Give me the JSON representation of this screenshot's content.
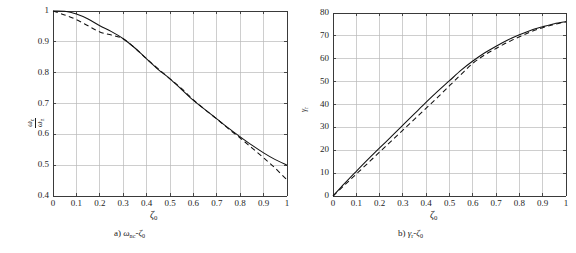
{
  "figure": {
    "background": "#ffffff",
    "axis_color": "#3a3a3a",
    "grid_color": "#b9b9b9",
    "curve_color": "#111111"
  },
  "panels": [
    {
      "id": "panel-a",
      "caption": "a) ωnc-ζ0",
      "caption_parts": {
        "prefix": "a) ",
        "sym1": "ω",
        "sub1": "nc",
        "dash": "-",
        "sym2": "ζ",
        "sub2": "0"
      },
      "xlabel": "ζ",
      "xlabel_sub": "0",
      "ylabel_num": "ω",
      "ylabel_num_sub": "c",
      "ylabel_den": "ω",
      "ylabel_den_sub": "n",
      "xticks": [
        "0",
        "0.1",
        "0.2",
        "0.3",
        "0.4",
        "0.5",
        "0.6",
        "0.7",
        "0.8",
        "0.9",
        "1"
      ],
      "yticks": [
        "0.4",
        "0.5",
        "0.6",
        "0.7",
        "0.8",
        "0.9",
        "1"
      ]
    },
    {
      "id": "panel-b",
      "caption": "b) γr-ζ0",
      "caption_parts": {
        "prefix": "b) ",
        "sym1": "γ",
        "sub1": "r",
        "dash": "-",
        "sym2": "ζ",
        "sub2": "0"
      },
      "xlabel": "ζ",
      "xlabel_sub": "0",
      "ylabel_num": "γ",
      "ylabel_num_sub": "r",
      "ylabel_den": "",
      "ylabel_den_sub": "",
      "xticks": [
        "0",
        "0.1",
        "0.2",
        "0.3",
        "0.4",
        "0.5",
        "0.6",
        "0.7",
        "0.8",
        "0.9",
        "1"
      ],
      "yticks": [
        "0",
        "10",
        "20",
        "30",
        "40",
        "50",
        "60",
        "70",
        "80"
      ]
    }
  ],
  "chart_data": [
    {
      "type": "line",
      "title": "a) ωnc-ζ0",
      "xlabel": "ζ0",
      "ylabel": "ωc/ωn",
      "xlim": [
        0,
        1
      ],
      "ylim": [
        0.4,
        1.0
      ],
      "xticks": [
        0,
        0.1,
        0.2,
        0.3,
        0.4,
        0.5,
        0.6,
        0.7,
        0.8,
        0.9,
        1
      ],
      "yticks": [
        0.4,
        0.5,
        0.6,
        0.7,
        0.8,
        0.9,
        1
      ],
      "grid": true,
      "legend": "none",
      "x": [
        0,
        0.05,
        0.1,
        0.15,
        0.2,
        0.25,
        0.3,
        0.35,
        0.4,
        0.45,
        0.5,
        0.55,
        0.6,
        0.65,
        0.7,
        0.75,
        0.8,
        0.85,
        0.9,
        0.95,
        1.0
      ],
      "series": [
        {
          "name": "solid",
          "style": "solid",
          "values": [
            1.0,
            0.999,
            0.99,
            0.974,
            0.952,
            0.933,
            0.91,
            0.88,
            0.845,
            0.81,
            0.78,
            0.745,
            0.71,
            0.68,
            0.65,
            0.62,
            0.592,
            0.565,
            0.54,
            0.518,
            0.5
          ]
        },
        {
          "name": "dashed",
          "style": "dashed",
          "values": [
            1.0,
            0.987,
            0.972,
            0.952,
            0.932,
            0.922,
            0.91,
            0.88,
            0.845,
            0.812,
            0.78,
            0.748,
            0.712,
            0.68,
            0.65,
            0.618,
            0.588,
            0.556,
            0.524,
            0.49,
            0.452
          ]
        }
      ]
    },
    {
      "type": "line",
      "title": "b) γr-ζ0",
      "xlabel": "ζ0",
      "ylabel": "γr",
      "xlim": [
        0,
        1
      ],
      "ylim": [
        0,
        80
      ],
      "xticks": [
        0,
        0.1,
        0.2,
        0.3,
        0.4,
        0.5,
        0.6,
        0.7,
        0.8,
        0.9,
        1
      ],
      "yticks": [
        0,
        10,
        20,
        30,
        40,
        50,
        60,
        70,
        80
      ],
      "grid": true,
      "legend": "none",
      "x": [
        0,
        0.05,
        0.1,
        0.15,
        0.2,
        0.25,
        0.3,
        0.35,
        0.4,
        0.45,
        0.5,
        0.55,
        0.6,
        0.65,
        0.7,
        0.75,
        0.8,
        0.85,
        0.9,
        0.95,
        1.0
      ],
      "series": [
        {
          "name": "solid",
          "style": "solid",
          "values": [
            0,
            5.5,
            10.8,
            16.0,
            21.0,
            26.0,
            31.0,
            36.0,
            41.0,
            45.8,
            50.4,
            55.0,
            59.0,
            62.5,
            65.5,
            68.2,
            70.5,
            72.5,
            74.0,
            75.3,
            76.2
          ]
        },
        {
          "name": "dashed",
          "style": "dashed",
          "values": [
            0,
            4.8,
            9.6,
            14.4,
            19.2,
            24.0,
            28.8,
            33.6,
            38.4,
            43.2,
            48.2,
            53.2,
            58.0,
            61.6,
            64.5,
            67.2,
            69.6,
            71.8,
            73.6,
            75.0,
            76.2
          ]
        }
      ]
    }
  ]
}
